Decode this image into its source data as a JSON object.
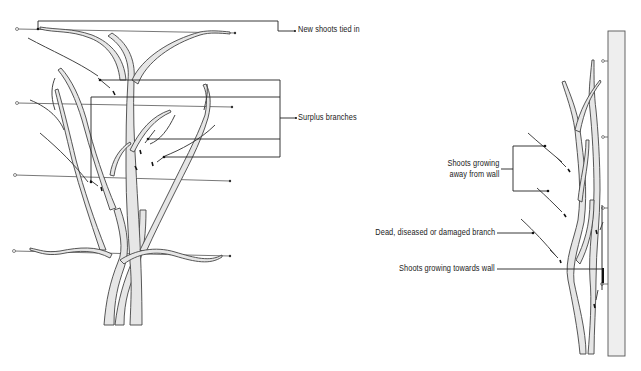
{
  "diagram": {
    "left_panel": {
      "title": "Fan-trained wall shrub pruning",
      "labels": [
        {
          "id": "new_shoots",
          "text": "New shoots tied in"
        },
        {
          "id": "surplus",
          "text": "Surplus branches"
        }
      ],
      "wires": 4
    },
    "right_panel": {
      "labels": [
        {
          "id": "away",
          "line1": "Shoots growing",
          "line2": "away from wall"
        },
        {
          "id": "dead",
          "text": "Dead, diseased or damaged branch"
        },
        {
          "id": "towards",
          "text": "Shoots growing towards wall"
        }
      ]
    },
    "colors": {
      "branch_fill": "#e6e6e6",
      "wall_fill": "#eeeeee",
      "line": "#333333"
    }
  }
}
